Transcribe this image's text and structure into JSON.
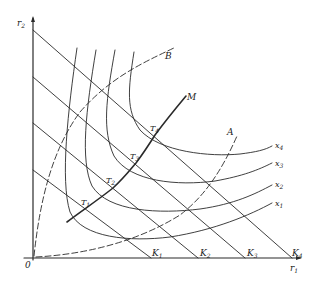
{
  "diagram": {
    "axes": {
      "x_label": "r",
      "x_sub": "1",
      "y_label": "r",
      "y_sub": "2",
      "origin_label": "0"
    },
    "budget_lines": [
      {
        "label": "K",
        "sub": "1"
      },
      {
        "label": "K",
        "sub": "2"
      },
      {
        "label": "K",
        "sub": "3"
      },
      {
        "label": "K",
        "sub": "4"
      }
    ],
    "isoquants": [
      {
        "label": "x",
        "sub": "1"
      },
      {
        "label": "x",
        "sub": "2"
      },
      {
        "label": "x",
        "sub": "3"
      },
      {
        "label": "x",
        "sub": "4"
      }
    ],
    "tangency_points": [
      {
        "label": "T",
        "sub": "1"
      },
      {
        "label": "T",
        "sub": "2"
      },
      {
        "label": "T",
        "sub": "3"
      },
      {
        "label": "T",
        "sub": "4"
      }
    ],
    "expansion_path": {
      "label": "M"
    },
    "ridge_lines": [
      {
        "label": "A"
      },
      {
        "label": "B"
      }
    ],
    "colors": {
      "ink": "#2a2a2a",
      "background": "#ffffff"
    }
  }
}
